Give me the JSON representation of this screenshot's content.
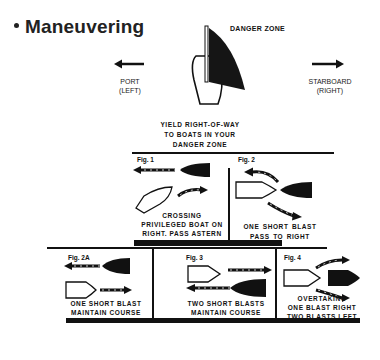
{
  "title": "Maneuvering",
  "top": {
    "danger_zone_label": "DANGER ZONE",
    "port_label": [
      "PORT",
      "(LEFT)"
    ],
    "starboard_label": [
      "STARBOARD",
      "(RIGHT)"
    ],
    "yield_text": [
      "YIELD RIGHT-OF-WAY",
      "TO BOATS IN YOUR",
      "DANGER ZONE"
    ]
  },
  "figures": [
    {
      "id": "fig1",
      "label": "Fig. 1",
      "caption": [
        "CROSSING",
        "PRIVILEGED BOAT ON",
        "RIGHT. PASS ASTERN"
      ]
    },
    {
      "id": "fig2",
      "label": "Fig. 2",
      "caption": [
        "ONE  SHORT  BLAST",
        "PASS   TO   RIGHT"
      ]
    },
    {
      "id": "fig2a",
      "label": "Fig. 2A",
      "caption": [
        "ONE  SHORT  BLAST",
        "MAINTAIN  COURSE"
      ]
    },
    {
      "id": "fig3",
      "label": "Fig. 3",
      "caption": [
        "TWO SHORT BLASTS",
        "MAINTAIN  COURSE"
      ]
    },
    {
      "id": "fig4",
      "label": "Fig. 4",
      "caption": [
        "OVERTAKING",
        "ONE  BLAST  RIGHT",
        "TWO  BLASTS  LEFT"
      ]
    }
  ],
  "colors": {
    "ink": "#111111",
    "background": "#ffffff"
  }
}
